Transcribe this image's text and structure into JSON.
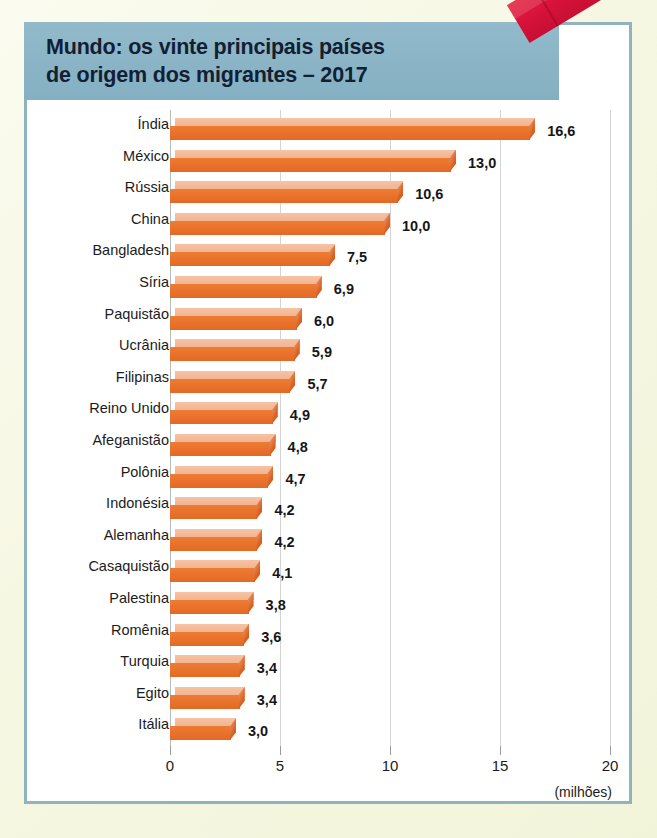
{
  "header": {
    "title_line1": "Mundo: os vinte principais países",
    "title_line2": "de origem dos migrantes – 2017",
    "band_color": "#8ab4c6",
    "title_color": "#132033"
  },
  "decoration": {
    "tape_color": "#d8123a",
    "tape_name": "red-tape-sticker"
  },
  "frame": {
    "border_color": "#8fb3bf",
    "page_background": "#f7f8e4",
    "card_background": "#ffffff"
  },
  "chart_data": {
    "type": "bar",
    "orientation": "horizontal",
    "title": "Mundo: os vinte principais países de origem dos migrantes – 2017",
    "xlabel": "(milhões)",
    "ylabel": "",
    "xlim": [
      0,
      20
    ],
    "xticks": [
      "0",
      "5",
      "10",
      "15",
      "20"
    ],
    "xtick_values": [
      0,
      5,
      10,
      15,
      20
    ],
    "grid": true,
    "grid_axis": "x",
    "legend": null,
    "bar_color": "#e8702a",
    "bar_top_color": "#f3b392",
    "categories": [
      "Índia",
      "México",
      "Rússia",
      "China",
      "Bangladesh",
      "Síria",
      "Paquistão",
      "Ucrânia",
      "Filipinas",
      "Reino Unido",
      "Afeganistão",
      "Polônia",
      "Indonésia",
      "Alemanha",
      "Casaquistão",
      "Palestina",
      "Romênia",
      "Turquia",
      "Egito",
      "Itália"
    ],
    "values": [
      16.6,
      13.0,
      10.6,
      10.0,
      7.5,
      6.9,
      6.0,
      5.9,
      5.7,
      4.9,
      4.8,
      4.7,
      4.2,
      4.2,
      4.1,
      3.8,
      3.6,
      3.4,
      3.4,
      3.0
    ],
    "value_labels": [
      "16,6",
      "13,0",
      "10,6",
      "10,0",
      "7,5",
      "6,9",
      "6,0",
      "5,9",
      "5,7",
      "4,9",
      "4,8",
      "4,7",
      "4,2",
      "4,2",
      "4,1",
      "3,8",
      "3,6",
      "3,4",
      "3,4",
      "3,0"
    ]
  }
}
